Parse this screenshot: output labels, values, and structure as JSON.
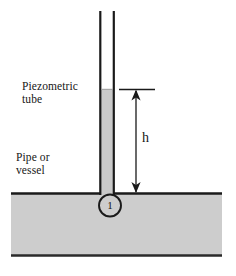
{
  "figure": {
    "labels": {
      "piezometric_tube": "Piezometric\ntube",
      "pipe_or_vessel": "Pipe or\nvessel",
      "height_dimension": "h",
      "point_1": "1"
    },
    "colors": {
      "liquid_fill": "#c9c9c9",
      "vessel_fill": "#cdcdcd",
      "outline": "#1a1a1a",
      "background": "#ffffff",
      "text": "#161616"
    },
    "geometry": {
      "tube_left_wall_x": 100,
      "tube_right_wall_x": 114,
      "tube_top_y": 11,
      "tube_inner_width": 12,
      "liquid_level_y": 89,
      "vessel_top_y": 193,
      "vessel_bottom_y": 256,
      "vessel_left_x": 11,
      "vessel_right_x": 222,
      "dimension_line_x": 136,
      "dimension_top_y": 90,
      "dimension_bottom_y": 192,
      "tick_mark_left_x": 119,
      "tick_mark_right_x": 155,
      "point_circle_cx": 110,
      "point_circle_cy": 205,
      "point_circle_r": 11
    },
    "annotations": {
      "h_meaning": "piezometric head measured from pipe centerline level to liquid surface in tube",
      "arrow_style": "double-headed vertical dimension arrow"
    }
  }
}
